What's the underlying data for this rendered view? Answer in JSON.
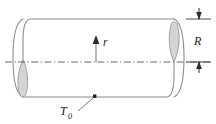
{
  "figure": {
    "kind": "engineering-diagram",
    "labels": {
      "radius": "R",
      "radial_coordinate": "r",
      "surface_temperature_base": "T",
      "surface_temperature_subscript": "0"
    },
    "colors": {
      "outline": "#8c8c8c",
      "centerline": "#5a5a5a",
      "lens_fill": "#d4d4d4",
      "lens_stroke": "#9a9a9a",
      "text": "#1a1a1a",
      "arrow": "#2b2b2b",
      "leader": "#6e6e6e",
      "background": "#ffffff"
    },
    "geometry": {
      "body_left_x": 23,
      "body_right_x": 174,
      "top_edge_y": 19,
      "bottom_edge_y": 97,
      "centerline_y": 62,
      "left_lens_center_x": 23,
      "left_lens_top_y": 60,
      "left_lens_bottom_y": 98,
      "right_lens_center_x": 174,
      "right_lens_top_y": 21,
      "right_lens_bottom_y": 62,
      "r_arrow_x": 96,
      "r_arrow_tail_y": 62,
      "r_arrow_head_y": 38,
      "dimension_x": 199,
      "dimension_top_y": 19,
      "dimension_bottom_y": 62,
      "t0_dot_x": 95,
      "t0_dot_y": 96
    }
  }
}
